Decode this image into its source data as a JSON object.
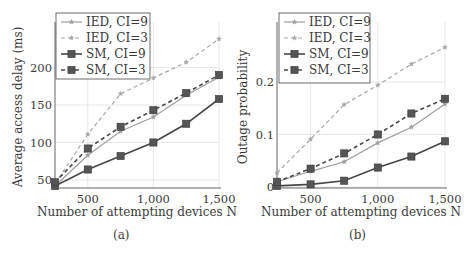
{
  "chart_data": [
    {
      "id": "a",
      "type": "line",
      "title": "",
      "caption": "(a)",
      "xlabel": "Number of attempting devices N",
      "ylabel": "Average access delay (ms)",
      "x": [
        250,
        500,
        750,
        1000,
        1250,
        1500
      ],
      "xticks": [
        500,
        1000,
        1500
      ],
      "xtick_labels": [
        "500",
        "1,000",
        "1,500"
      ],
      "yticks": [
        50,
        100,
        150,
        200
      ],
      "ytick_labels": [
        "50",
        "100",
        "150",
        "200"
      ],
      "xlim": [
        250,
        1500
      ],
      "ylim": [
        40,
        240
      ],
      "grid": true,
      "legend_position": "upper left",
      "series": [
        {
          "name": "IED, CI=9",
          "values": [
            42,
            83,
            115,
            134,
            163,
            187
          ],
          "color": "#9e9e9e",
          "dash": false,
          "marker": "star"
        },
        {
          "name": "IED, CI=3",
          "values": [
            45,
            111,
            165,
            186,
            207,
            238
          ],
          "color": "#a8a8a8",
          "dash": true,
          "marker": "star"
        },
        {
          "name": "SM, CI=9",
          "values": [
            42,
            64,
            82,
            100,
            125,
            158
          ],
          "color": "#474747",
          "dash": false,
          "marker": "square"
        },
        {
          "name": "SM, CI=3",
          "values": [
            47,
            92,
            121,
            143,
            166,
            190
          ],
          "color": "#474747",
          "dash": true,
          "marker": "square"
        }
      ]
    },
    {
      "id": "b",
      "type": "line",
      "title": "",
      "caption": "(b)",
      "xlabel": "Number of attempting devices N",
      "ylabel": "Outage probability",
      "x": [
        250,
        500,
        750,
        1000,
        1250,
        1500
      ],
      "xticks": [
        500,
        1000,
        1500
      ],
      "xtick_labels": [
        "500",
        "1,000",
        "1,500"
      ],
      "yticks": [
        0,
        0.1,
        0.2
      ],
      "ytick_labels": [
        "0",
        "0.1",
        "0.2"
      ],
      "xlim": [
        250,
        1500
      ],
      "ylim": [
        0,
        0.27
      ],
      "grid": true,
      "legend_position": "upper left",
      "series": [
        {
          "name": "IED, CI=9",
          "values": [
            0.01,
            0.03,
            0.048,
            0.084,
            0.114,
            0.158
          ],
          "color": "#9e9e9e",
          "dash": false,
          "marker": "star"
        },
        {
          "name": "IED, CI=3",
          "values": [
            0.027,
            0.091,
            0.157,
            0.194,
            0.234,
            0.266
          ],
          "color": "#a8a8a8",
          "dash": true,
          "marker": "star"
        },
        {
          "name": "SM, CI=9",
          "values": [
            0.002,
            0.005,
            0.012,
            0.037,
            0.058,
            0.087
          ],
          "color": "#474747",
          "dash": false,
          "marker": "square"
        },
        {
          "name": "SM, CI=3",
          "values": [
            0.01,
            0.035,
            0.064,
            0.1,
            0.14,
            0.168
          ],
          "color": "#474747",
          "dash": true,
          "marker": "square"
        }
      ]
    }
  ],
  "panels": {
    "a": {
      "caption": "(a)",
      "xlabel": "Number of attempting devices N",
      "ylabel": "Average access delay (ms)"
    },
    "b": {
      "caption": "(b)",
      "xlabel": "Number of attempting devices N",
      "ylabel": "Outage probability"
    }
  }
}
